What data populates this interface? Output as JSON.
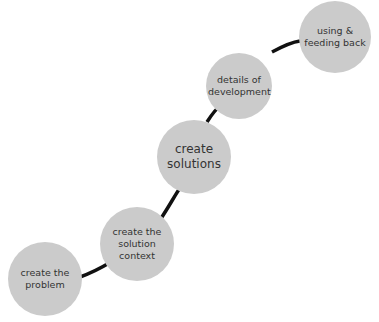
{
  "diagram": {
    "type": "process-path",
    "connector_color": "#111111",
    "node_color": "#cbcbcb",
    "nodes": [
      {
        "id": "problem",
        "label": "create the problem"
      },
      {
        "id": "context",
        "label": "create the solution context"
      },
      {
        "id": "solutions",
        "label": "create solutions"
      },
      {
        "id": "development",
        "label": "details of development"
      },
      {
        "id": "feedback",
        "label": "using & feeding back"
      }
    ]
  }
}
